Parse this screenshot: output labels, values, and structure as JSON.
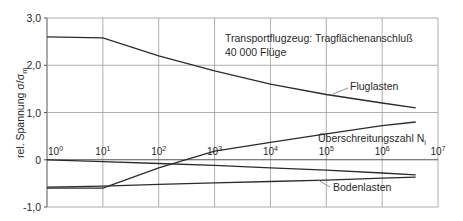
{
  "chart_data": {
    "type": "line",
    "title": "Transportflugzeug: Tragflächenanschluß",
    "subtitle": "40 000 Flüge",
    "xlabel": "Überschreitungszahl N_i",
    "xlabel_main": "Überschreitungszahl N",
    "xlabel_sub": "i",
    "ylabel": "rel. Spannung σ/σm",
    "ylabel_main": "rel. Spannung σ/σ",
    "ylabel_sub": "m",
    "xscale": "log",
    "xlim": [
      1,
      10000000
    ],
    "ylim": [
      -1.0,
      3.0
    ],
    "grid": true,
    "x_ticks": [
      {
        "exp": 0,
        "base": "10",
        "sup": "0"
      },
      {
        "exp": 1,
        "base": "10",
        "sup": "1"
      },
      {
        "exp": 2,
        "base": "10",
        "sup": "2"
      },
      {
        "exp": 3,
        "base": "10",
        "sup": "3"
      },
      {
        "exp": 4,
        "base": "10",
        "sup": "4"
      },
      {
        "exp": 5,
        "base": "10",
        "sup": "5"
      },
      {
        "exp": 6,
        "base": "10",
        "sup": "6"
      },
      {
        "exp": 7,
        "base": "10",
        "sup": "7"
      }
    ],
    "y_ticks": [
      {
        "value": 3.0,
        "label": "3,0"
      },
      {
        "value": 2.0,
        "label": "2,0"
      },
      {
        "value": 1.0,
        "label": "1,0"
      },
      {
        "value": 0.0,
        "label": "0"
      },
      {
        "value": -1.0,
        "label": "-1,0"
      }
    ],
    "series": [
      {
        "name": "Fluglasten (max)",
        "label": "Fluglasten",
        "points": [
          [
            0,
            2.6
          ],
          [
            1,
            2.58
          ],
          [
            2,
            2.2
          ],
          [
            3,
            1.88
          ],
          [
            4,
            1.6
          ],
          [
            5,
            1.38
          ],
          [
            6,
            1.2
          ],
          [
            6.6,
            1.1
          ]
        ]
      },
      {
        "name": "Fluglasten (min)",
        "label": "",
        "points": [
          [
            0,
            -0.6
          ],
          [
            1,
            -0.6
          ],
          [
            2,
            -0.17
          ],
          [
            3,
            0.18
          ],
          [
            4,
            0.37
          ],
          [
            5,
            0.55
          ],
          [
            6,
            0.72
          ],
          [
            6.6,
            0.8
          ]
        ]
      },
      {
        "name": "Bodenlasten (max)",
        "label": "",
        "points": [
          [
            0,
            0.0
          ],
          [
            1,
            -0.04
          ],
          [
            2,
            -0.08
          ],
          [
            3,
            -0.12
          ],
          [
            4,
            -0.17
          ],
          [
            5,
            -0.22
          ],
          [
            6,
            -0.28
          ],
          [
            6.6,
            -0.32
          ]
        ]
      },
      {
        "name": "Bodenlasten (min)",
        "label": "Bodenlasten",
        "points": [
          [
            0,
            -0.58
          ],
          [
            1,
            -0.56
          ],
          [
            2,
            -0.52
          ],
          [
            3,
            -0.49
          ],
          [
            4,
            -0.46
          ],
          [
            5,
            -0.43
          ],
          [
            6,
            -0.39
          ],
          [
            6.6,
            -0.37
          ]
        ]
      }
    ],
    "annotations": [
      {
        "text": "Fluglasten",
        "target_series": 0
      },
      {
        "text": "Bodenlasten",
        "target_series": 3
      }
    ]
  }
}
